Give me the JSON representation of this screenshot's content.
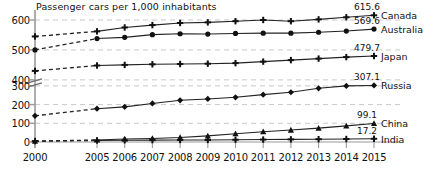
{
  "chart_data": {
    "type": "line",
    "title": "Passenger cars per 1,000 inhabitants",
    "xlabel": "",
    "ylabel": "",
    "grid": true,
    "legend_position": "right-inline",
    "axis_break": {
      "from": 300,
      "to": 400,
      "label": "y-axis-break"
    },
    "ylim": [
      0,
      620
    ],
    "yticks": [
      0,
      100,
      200,
      300,
      400,
      500,
      600
    ],
    "ytick_labels": [
      "0",
      "100",
      "200",
      "300",
      "400",
      "500",
      "600"
    ],
    "x": [
      2000,
      2005,
      2006,
      2007,
      2008,
      2009,
      2010,
      2011,
      2012,
      2013,
      2014,
      2015
    ],
    "xtick_labels": [
      "2000",
      "2005",
      "2006",
      "2007",
      "2008",
      "2009",
      "2010",
      "2011",
      "2012",
      "2013",
      "2014",
      "2015"
    ],
    "x_gap_after_index": 0,
    "series": [
      {
        "name": "Canada",
        "marker": "plus",
        "end_value": "615.6",
        "values": [
          545,
          562,
          575,
          583,
          590,
          592,
          596,
          600,
          596,
          602,
          609,
          615.6
        ]
      },
      {
        "name": "Australia",
        "marker": "circle",
        "end_value": "569.6",
        "values": [
          500,
          538,
          542,
          551,
          554,
          553,
          555,
          556,
          556,
          559,
          563,
          569.6
        ]
      },
      {
        "name": "Japan",
        "marker": "plus",
        "end_value": "479.7",
        "values": [
          430,
          448,
          450,
          452,
          453,
          454,
          456,
          461,
          466,
          471,
          476,
          479.7
        ]
      },
      {
        "name": "Russia",
        "marker": "diamond",
        "end_value": "307.1",
        "values": [
          140,
          178,
          188,
          206,
          223,
          230,
          239,
          253,
          266,
          287,
          300,
          307.1
        ]
      },
      {
        "name": "China",
        "marker": "triangle",
        "end_value": "99.1",
        "values": [
          4,
          11,
          16,
          19,
          24,
          33,
          44,
          55,
          64,
          74,
          86,
          99.1
        ]
      },
      {
        "name": "India",
        "marker": "plus",
        "end_value": "17.2",
        "values": [
          5,
          8,
          9,
          10,
          11,
          11,
          12,
          13,
          14,
          15,
          16,
          17.2
        ]
      }
    ],
    "colors": {
      "line": "#222222",
      "marker": "#111111",
      "grid": "#c9c9c9",
      "axis": "#9a9a9a",
      "text": "#111111"
    }
  }
}
